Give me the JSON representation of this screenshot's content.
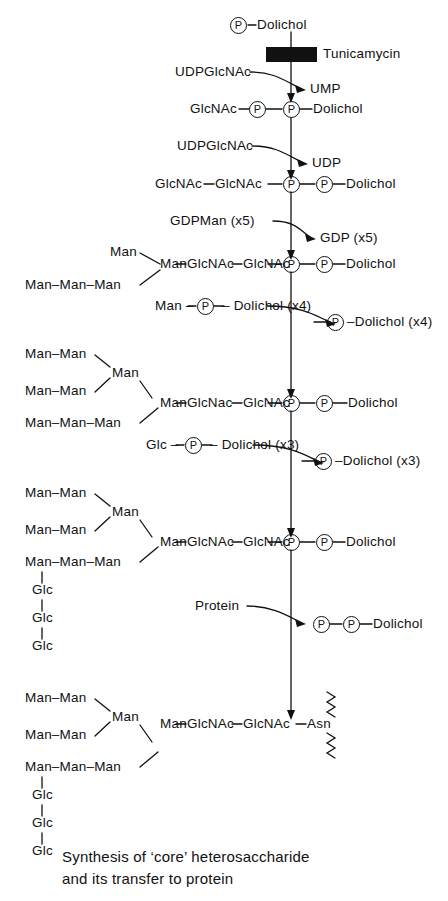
{
  "figure": {
    "caption": "Synthesis of ‘core’ heterosaccharide\nand its transfer to protein",
    "inhibitor": {
      "name": "Tunicamycin",
      "blocks_step": 1
    },
    "stroke_color": "#111111",
    "background": "#ffffff"
  },
  "steps": [
    {
      "id": "step1-substrate",
      "product": "P–Dolichol",
      "parts": {
        "dolichol": "Dolichol",
        "phosphate": "P"
      }
    },
    {
      "id": "step1-reaction",
      "substrate_in": "UDPGlcNAc",
      "byproduct_out": "UMP",
      "inhibitor": "Tunicamycin"
    },
    {
      "id": "step2-product",
      "chain": [
        "GlcNAc"
      ],
      "phosphates": [
        "P",
        "P"
      ],
      "dolichol": "Dolichol"
    },
    {
      "id": "step2-reaction",
      "substrate_in": "UDPGlcNAc",
      "byproduct_out": "UDP"
    },
    {
      "id": "step3-product",
      "chain": [
        "GlcNAc",
        "GlcNAc"
      ],
      "phosphates": [
        "P",
        "P"
      ],
      "dolichol": "Dolichol"
    },
    {
      "id": "step3-reaction",
      "substrate_in": "GDPMan (x5)",
      "byproduct_out": "GDP (x5)"
    },
    {
      "id": "step4-product",
      "branches": [
        "Man",
        "Man–Man–Man"
      ],
      "chain": [
        "Man",
        "GlcNAc",
        "GlcNAc"
      ],
      "phosphates": [
        "P",
        "P"
      ],
      "dolichol": "Dolichol"
    },
    {
      "id": "step4-reaction",
      "substrate_in_prefix": "Man –",
      "substrate_in_mid": "P",
      "substrate_in_suffix": "– Dolichol (x4)",
      "byproduct_out_mid": "P",
      "byproduct_out_suffix": "–Dolichol (x4)"
    },
    {
      "id": "step5-product",
      "branches": [
        "Man–Man",
        "Man–Man",
        "Man–Man–Man"
      ],
      "branch_node": "Man",
      "chain": [
        "Man",
        "GlcNac",
        "GlcNAc"
      ],
      "phosphates": [
        "P",
        "P"
      ],
      "dolichol": "Dolichol"
    },
    {
      "id": "step5-reaction",
      "substrate_in_prefix": "Glc –",
      "substrate_in_mid": "P",
      "substrate_in_suffix": "– Dolichol (x3)",
      "byproduct_out_mid": "P",
      "byproduct_out_suffix": "–Dolichol (x3)"
    },
    {
      "id": "step6-product",
      "branches": [
        "Man–Man",
        "Man–Man",
        "Man–Man–Man"
      ],
      "branch_node": "Man",
      "glc_chain": [
        "Glc",
        "Glc",
        "Glc"
      ],
      "chain": [
        "Man",
        "GlcNAc",
        "GlcNAc"
      ],
      "phosphates": [
        "P",
        "P"
      ],
      "dolichol": "Dolichol"
    },
    {
      "id": "step6-reaction",
      "substrate_in": "Protein",
      "byproduct_phosphates": [
        "P",
        "P"
      ],
      "byproduct_dolichol": "Dolichol"
    },
    {
      "id": "step7-product",
      "branches": [
        "Man–Man",
        "Man–Man",
        "Man–Man–Man"
      ],
      "branch_node": "Man",
      "glc_chain": [
        "Glc",
        "Glc",
        "Glc"
      ],
      "chain": [
        "Man",
        "GlcNAc",
        "GlcNAc"
      ],
      "terminal": "Asn",
      "protein_backbone": "zigzag"
    }
  ],
  "labels": {
    "man": "Man",
    "glc": "Glc",
    "glcnac": "GlcNAc",
    "glcnac_alt": "GlcNac",
    "asn": "Asn",
    "dolichol": "Dolichol",
    "phosphate": "P",
    "udpglcnac": "UDPGlcNAc",
    "ump": "UMP",
    "udp": "UDP",
    "gdpman_x5": "GDPMan (x5)",
    "gdp_x5": "GDP (x5)",
    "protein": "Protein",
    "tunicamycin": "Tunicamycin",
    "man_p_dolichol_x4_prefix": "Man –",
    "man_p_dolichol_x4_suffix": "– Dolichol (x4)",
    "p_dolichol_x4_suffix": "–Dolichol (x4)",
    "glc_p_dolichol_x3_prefix": "Glc –",
    "glc_p_dolichol_x3_suffix": "– Dolichol (x3)",
    "p_dolichol_x3_suffix": "–Dolichol (x3)",
    "man_man": "Man–Man",
    "man_man_man": "Man–Man–Man",
    "dash": "–"
  }
}
